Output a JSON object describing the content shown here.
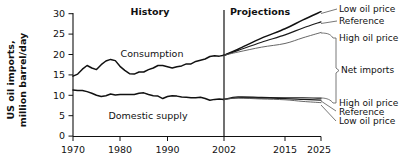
{
  "chart_data": {
    "type": "line",
    "title": "",
    "xlabel": "",
    "ylabel": "US oil imports,\nmillion barrel/day",
    "ylabel_line1": "US oil imports,",
    "ylabel_line2": "million barrel/day",
    "xlim": [
      1970,
      2025
    ],
    "ylim": [
      0,
      30
    ],
    "yticks": [
      0,
      5,
      10,
      15,
      20,
      25,
      30
    ],
    "ytick_labels": [
      "0",
      "5",
      "10",
      "15",
      "20",
      "25",
      "30"
    ],
    "xticks": [
      1970,
      1980,
      1990,
      2002,
      2015,
      2025
    ],
    "xtick_labels": [
      "1970",
      "1980",
      "1990",
      "2002",
      "2015",
      "2025"
    ],
    "grid": false,
    "legend_position": "right-annotations",
    "divider_x": 2002,
    "period_labels": [
      {
        "text": "History",
        "x": 1986
      },
      {
        "text": "Projections",
        "x": 2009
      }
    ],
    "inline_labels": [
      {
        "text": "Consumption",
        "x": 1985,
        "y": 21.6
      },
      {
        "text": "Domestic supply",
        "x": 1987,
        "y": 6.3
      }
    ],
    "annotations": [
      {
        "text": "Low oil price",
        "group": "consumption",
        "end_value": 30.5
      },
      {
        "text": "Reference",
        "group": "consumption",
        "end_value": 28.0
      },
      {
        "text": "High oil price",
        "group": "consumption",
        "end_value": 25.4
      },
      {
        "text": "Net imports",
        "group": "bracket",
        "end_value": null
      },
      {
        "text": "High oil price",
        "group": "domestic-supply",
        "end_value": 9.3
      },
      {
        "text": "Reference",
        "group": "domestic-supply",
        "end_value": 8.8
      },
      {
        "text": "Low oil price",
        "group": "domestic-supply",
        "end_value": 8.2
      }
    ],
    "series": [
      {
        "name": "Consumption (history)",
        "style": "thick",
        "x": [
          1970,
          1971,
          1972,
          1973,
          1974,
          1975,
          1976,
          1977,
          1978,
          1979,
          1980,
          1981,
          1982,
          1983,
          1984,
          1985,
          1986,
          1987,
          1988,
          1989,
          1990,
          1991,
          1992,
          1993,
          1994,
          1995,
          1996,
          1997,
          1998,
          1999,
          2000,
          2001,
          2002
        ],
        "values": [
          14.7,
          15.2,
          16.4,
          17.3,
          16.7,
          16.3,
          17.5,
          18.4,
          18.8,
          18.5,
          17.1,
          16.1,
          15.3,
          15.2,
          15.7,
          15.7,
          16.3,
          16.7,
          17.3,
          17.3,
          17.0,
          16.7,
          17.0,
          17.2,
          17.7,
          17.7,
          18.3,
          18.6,
          18.9,
          19.5,
          19.7,
          19.6,
          19.8
        ]
      },
      {
        "name": "Domestic supply (history)",
        "style": "thick",
        "x": [
          1970,
          1971,
          1972,
          1973,
          1974,
          1975,
          1976,
          1977,
          1978,
          1979,
          1980,
          1981,
          1982,
          1983,
          1984,
          1985,
          1986,
          1987,
          1988,
          1989,
          1990,
          1991,
          1992,
          1993,
          1994,
          1995,
          1996,
          1997,
          1998,
          1999,
          2000,
          2001,
          2002
        ],
        "values": [
          11.3,
          11.2,
          11.2,
          10.9,
          10.5,
          10.0,
          9.7,
          9.9,
          10.3,
          10.1,
          10.2,
          10.2,
          10.2,
          10.2,
          10.5,
          10.6,
          10.2,
          9.9,
          9.8,
          9.2,
          9.7,
          9.9,
          9.8,
          9.6,
          9.5,
          9.4,
          9.4,
          9.5,
          9.2,
          8.8,
          9.0,
          9.1,
          9.0
        ]
      },
      {
        "name": "Consumption - Low oil price",
        "style": "thick",
        "x": [
          2002,
          2005,
          2010,
          2015,
          2020,
          2025
        ],
        "values": [
          19.8,
          21.3,
          24.0,
          26.3,
          28.5,
          30.5
        ]
      },
      {
        "name": "Consumption - Reference",
        "style": "med",
        "x": [
          2002,
          2005,
          2010,
          2015,
          2020,
          2025
        ],
        "values": [
          19.8,
          21.0,
          23.0,
          24.8,
          26.5,
          28.0
        ]
      },
      {
        "name": "Consumption - High oil price",
        "style": "thin",
        "x": [
          2002,
          2005,
          2010,
          2015,
          2020,
          2025
        ],
        "values": [
          19.8,
          20.6,
          21.8,
          22.7,
          24.1,
          25.4
        ]
      },
      {
        "name": "Domestic supply - High oil price",
        "style": "med",
        "x": [
          2002,
          2005,
          2010,
          2015,
          2020,
          2025
        ],
        "values": [
          9.0,
          9.6,
          9.5,
          9.4,
          9.4,
          9.3
        ]
      },
      {
        "name": "Domestic supply - Reference",
        "style": "med",
        "x": [
          2002,
          2005,
          2010,
          2015,
          2020,
          2025
        ],
        "values": [
          9.0,
          9.4,
          9.3,
          9.2,
          9.0,
          8.8
        ]
      },
      {
        "name": "Domestic supply - Low oil price",
        "style": "thin",
        "x": [
          2002,
          2005,
          2010,
          2015,
          2020,
          2025
        ],
        "values": [
          9.0,
          9.3,
          9.1,
          8.9,
          8.5,
          8.2
        ]
      }
    ]
  },
  "labels": {
    "ylabel_line1": "US oil imports,",
    "ylabel_line2": "million barrel/day",
    "history": "History",
    "projections": "Projections",
    "consumption": "Consumption",
    "domestic_supply": "Domestic supply",
    "low_oil_price_top": "Low oil price",
    "reference_top": "Reference",
    "high_oil_price_top": "High oil price",
    "net_imports": "Net imports",
    "high_oil_price_bottom": "High oil price",
    "reference_bottom": "Reference",
    "low_oil_price_bottom": "Low oil price",
    "y0": "0",
    "y5": "5",
    "y10": "10",
    "y15": "15",
    "y20": "20",
    "y25": "25",
    "y30": "30",
    "x1970": "1970",
    "x1980": "1980",
    "x1990": "1990",
    "x2002": "2002",
    "x2015": "2015",
    "x2025": "2025"
  },
  "colors": {
    "background": "#ffffff",
    "axis": "#111111",
    "series_dark": "#111111",
    "series_light": "#555555"
  }
}
